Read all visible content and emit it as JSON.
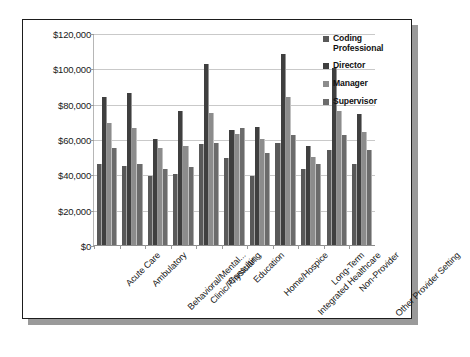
{
  "chart_data": {
    "type": "bar",
    "title": "",
    "xlabel": "",
    "ylabel": "",
    "ylim": [
      0,
      120000
    ],
    "ytick_labels": [
      "$120,000",
      "$100,000",
      "$80,000",
      "$60,000",
      "$40,000",
      "$20,000",
      "$0"
    ],
    "ytick_values": [
      120000,
      100000,
      80000,
      60000,
      40000,
      20000,
      0
    ],
    "grid": true,
    "legend_position": "right",
    "categories": [
      "Acute Care",
      "Ambulatory",
      "Behavioral/Mental...",
      "Clinic/Physician...",
      "Consulting",
      "Education",
      "Home/Hospice",
      "Integrated Healthcare",
      "Long-Term",
      "Non-Provider",
      "Other Provider Setting"
    ],
    "series": [
      {
        "name": "Coding Professional",
        "color": "#595959",
        "values": [
          46000,
          45000,
          39000,
          40000,
          57000,
          49000,
          39000,
          58000,
          43000,
          54000,
          46000
        ]
      },
      {
        "name": "Director",
        "color": "#3f3f3f",
        "values": [
          84000,
          86000,
          60000,
          76000,
          102500,
          65000,
          67000,
          108000,
          56000,
          100000,
          74000
        ]
      },
      {
        "name": "Manager",
        "color": "#8c8c8c",
        "values": [
          69000,
          66000,
          55000,
          56000,
          75000,
          63000,
          60000,
          84000,
          50000,
          76000,
          64000
        ]
      },
      {
        "name": "Supervisor",
        "color": "#6b6b6b",
        "values": [
          55000,
          46000,
          43000,
          44000,
          58000,
          66000,
          52000,
          62000,
          46000,
          62000,
          54000
        ]
      }
    ]
  }
}
